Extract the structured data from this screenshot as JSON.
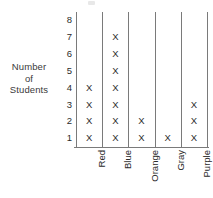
{
  "chart_data": {
    "type": "bar",
    "title": "",
    "subtitle": "",
    "xlabel": "",
    "ylabel": "Number of Students",
    "ylabel_lines": [
      "Number",
      "of",
      "Students"
    ],
    "categories": [
      "Red",
      "Blue",
      "Orange",
      "Gray",
      "Purple"
    ],
    "values": [
      4,
      7,
      2,
      1,
      3
    ],
    "yticks": [
      8,
      7,
      6,
      5,
      4,
      3,
      2,
      1
    ],
    "ylim": [
      0,
      8
    ],
    "grid": false,
    "legend": "none",
    "mark_glyph": "X"
  },
  "colors": {
    "background": "#ffffff",
    "text": "#2b2b2b",
    "rule": "#7a7a7a"
  },
  "icons": {
    "mark": "x-mark-icon"
  }
}
